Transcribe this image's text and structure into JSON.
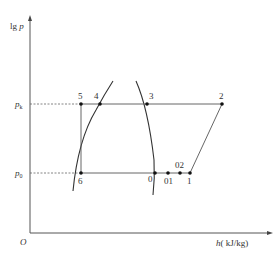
{
  "diagram": {
    "axes": {
      "y_label_prefix": "lg",
      "y_label_var": "p",
      "x_label_var": "h",
      "x_label_unit": "( kJ/kg)",
      "origin": "O"
    },
    "pressure_levels": [
      {
        "sym": "p",
        "sub": "k"
      },
      {
        "sym": "p",
        "sub": "0"
      }
    ],
    "points": [
      {
        "id": "5",
        "label": "5"
      },
      {
        "id": "4",
        "label": "4"
      },
      {
        "id": "3",
        "label": "3"
      },
      {
        "id": "2",
        "label": "2"
      },
      {
        "id": "6",
        "label": "6"
      },
      {
        "id": "0",
        "label": "0"
      },
      {
        "id": "01",
        "label": "01"
      },
      {
        "id": "02",
        "label": "02"
      },
      {
        "id": "1",
        "label": "1"
      }
    ],
    "colors": {
      "line": "#444444",
      "point": "#111111"
    }
  }
}
